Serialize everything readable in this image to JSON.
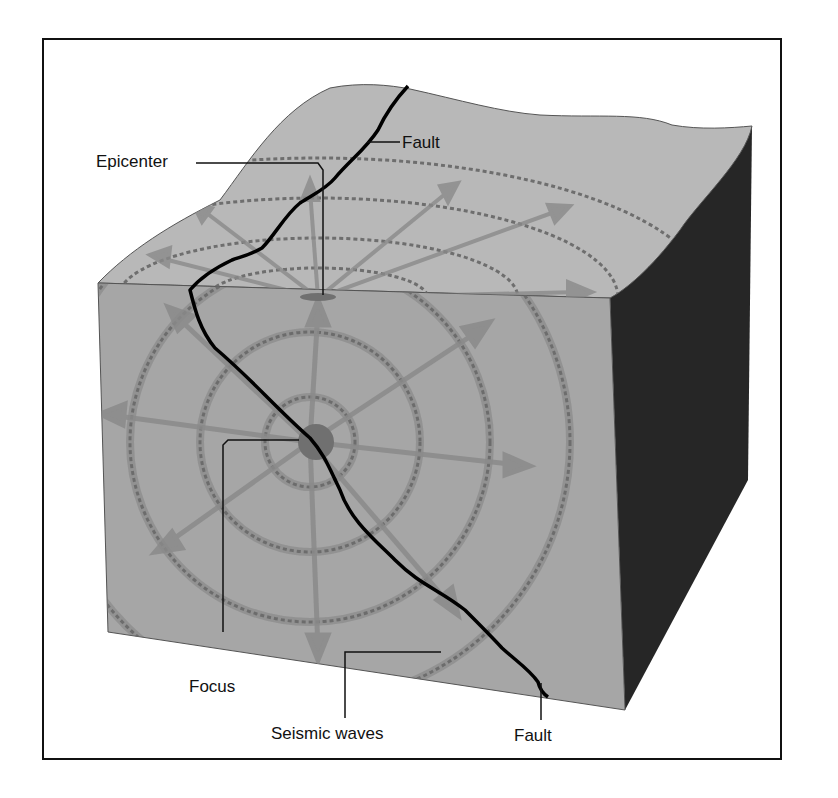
{
  "diagram": {
    "labels": {
      "epicenter": "Epicenter",
      "fault_top": "Fault",
      "focus": "Focus",
      "seismic_waves": "Seismic waves",
      "fault_bottom": "Fault"
    },
    "colors": {
      "block_front": "#a6a6a6",
      "block_top": "#b8b8b8",
      "block_side": "#262626",
      "waves": "#6e6e6e",
      "arrows": "#8a8a8a",
      "fault_line": "#000000",
      "focus": "#707070",
      "border": "#111111"
    }
  }
}
